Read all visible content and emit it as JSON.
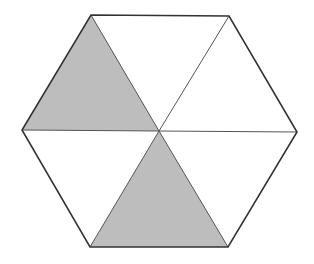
{
  "diagram": {
    "type": "hexagon-fraction",
    "center": [
      159,
      131
    ],
    "vertices": {
      "top_left": [
        91,
        15
      ],
      "top_right": [
        229,
        16
      ],
      "right": [
        297,
        132
      ],
      "bottom_right": [
        228,
        247
      ],
      "bottom_left": [
        90,
        247
      ],
      "left": [
        22,
        130
      ]
    },
    "triangles": [
      {
        "id": "top",
        "points": [
          "top_left",
          "top_right",
          "center"
        ],
        "shaded": false
      },
      {
        "id": "upper-right",
        "points": [
          "top_right",
          "right",
          "center"
        ],
        "shaded": false
      },
      {
        "id": "lower-right",
        "points": [
          "right",
          "bottom_right",
          "center"
        ],
        "shaded": false
      },
      {
        "id": "bottom",
        "points": [
          "bottom_right",
          "bottom_left",
          "center"
        ],
        "shaded": true
      },
      {
        "id": "lower-left",
        "points": [
          "bottom_left",
          "left",
          "center"
        ],
        "shaded": false
      },
      {
        "id": "upper-left",
        "points": [
          "left",
          "top_left",
          "center"
        ],
        "shaded": true
      }
    ],
    "total_parts": 6,
    "shaded_parts": 2,
    "colors": {
      "shade": "#bdbdbd",
      "unshaded": "#ffffff",
      "outline": "#333333",
      "inner_line": "#555555",
      "background": "#ffffff"
    }
  }
}
